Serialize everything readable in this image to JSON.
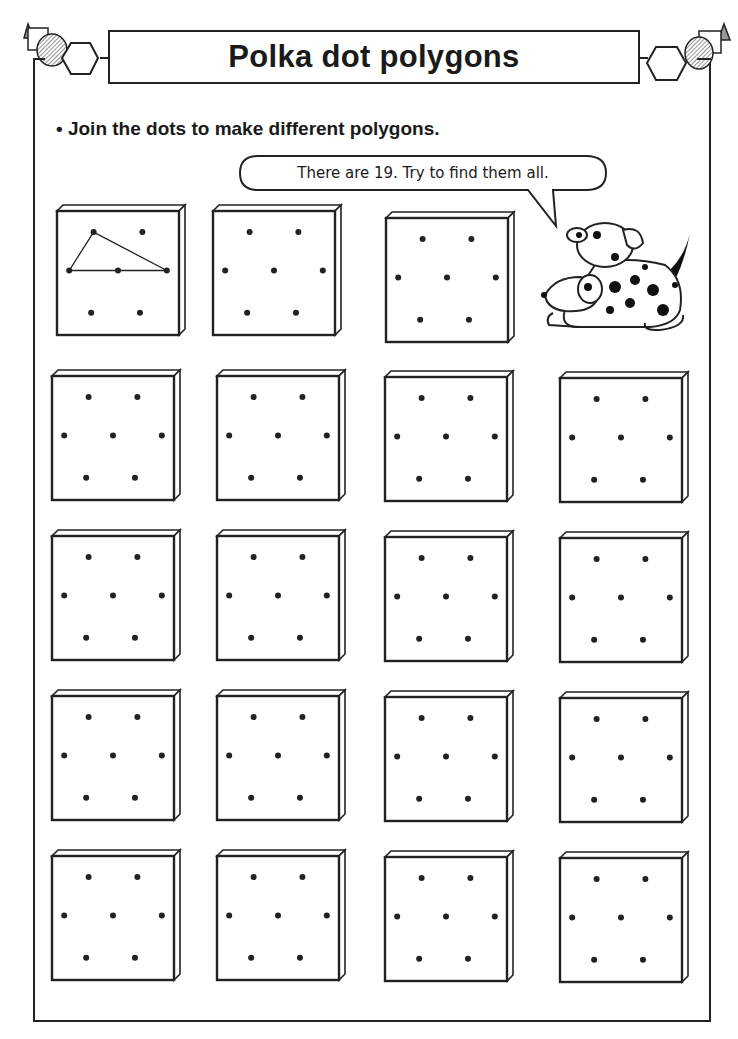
{
  "header": {
    "title": "Polka dot polygons"
  },
  "instruction": {
    "bullet": "•",
    "text": "Join the dots to make different polygons."
  },
  "speech_bubble": {
    "text": "There are 19. Try to find them all."
  },
  "grid": {
    "dot_pattern": "2-3-2 hexagonal arrangement of 7 dots",
    "total_cards": 19,
    "example_card": {
      "shape": "triangle",
      "description": "Example triangle joining top-left, middle-left and middle-right dots"
    },
    "cards": [
      {
        "x": 57,
        "y": 209,
        "w": 122,
        "h": 126,
        "example": true
      },
      {
        "x": 213,
        "y": 209,
        "w": 122,
        "h": 126
      },
      {
        "x": 386,
        "y": 216,
        "w": 122,
        "h": 126
      },
      {
        "x": 52,
        "y": 374,
        "w": 122,
        "h": 126
      },
      {
        "x": 217,
        "y": 374,
        "w": 122,
        "h": 126
      },
      {
        "x": 385,
        "y": 375,
        "w": 122,
        "h": 126
      },
      {
        "x": 560,
        "y": 376,
        "w": 122,
        "h": 126
      },
      {
        "x": 52,
        "y": 534,
        "w": 122,
        "h": 126
      },
      {
        "x": 217,
        "y": 534,
        "w": 122,
        "h": 126
      },
      {
        "x": 385,
        "y": 535,
        "w": 122,
        "h": 126
      },
      {
        "x": 560,
        "y": 536,
        "w": 122,
        "h": 126
      },
      {
        "x": 52,
        "y": 694,
        "w": 122,
        "h": 126
      },
      {
        "x": 217,
        "y": 694,
        "w": 122,
        "h": 126
      },
      {
        "x": 385,
        "y": 695,
        "w": 122,
        "h": 126
      },
      {
        "x": 560,
        "y": 696,
        "w": 122,
        "h": 126
      },
      {
        "x": 52,
        "y": 854,
        "w": 122,
        "h": 126
      },
      {
        "x": 217,
        "y": 854,
        "w": 122,
        "h": 126
      },
      {
        "x": 385,
        "y": 855,
        "w": 122,
        "h": 126
      },
      {
        "x": 560,
        "y": 856,
        "w": 122,
        "h": 126
      }
    ]
  },
  "colors": {
    "ink": "#222222",
    "paper": "#ffffff",
    "hatch": "#888888"
  }
}
